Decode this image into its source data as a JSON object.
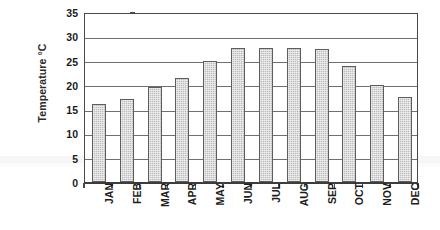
{
  "chart_data": {
    "type": "bar",
    "title": "",
    "xlabel": "",
    "ylabel": "Temperature °C",
    "categories": [
      "JAN",
      "FEB",
      "MAR",
      "APR",
      "MAY",
      "JUN",
      "JUL",
      "AUG",
      "SEP",
      "OCT",
      "NOV",
      "DEC"
    ],
    "values": [
      16,
      17,
      19.5,
      21.5,
      25,
      27.5,
      27.5,
      27.5,
      27.3,
      23.8,
      20,
      17.5
    ],
    "series": [
      {
        "name": "Temperature",
        "values": [
          16,
          17,
          19.5,
          21.5,
          25,
          27.5,
          27.5,
          27.5,
          27.3,
          23.8,
          20,
          17.5
        ]
      }
    ],
    "ylim": [
      0,
      35
    ],
    "y_ticks": [
      0,
      5,
      10,
      15,
      20,
      25,
      30,
      35
    ],
    "y_tick_labels": [
      "0",
      "5",
      "10",
      "15",
      "20",
      "25",
      "30",
      "35"
    ],
    "grid": "horizontal",
    "legend": "none",
    "bar_color": "#bdbdbd",
    "bar_edge_color": "#5d5d5d",
    "axis_color": "#4a4a4a",
    "gridline_color": "#707070",
    "background_color": "#ffffff"
  }
}
